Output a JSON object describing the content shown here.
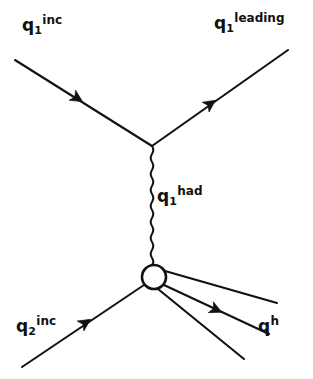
{
  "figure": {
    "kind": "feynman-diagram",
    "background_color": "#ffffff",
    "ink_color": "#111111",
    "width": 313,
    "height": 379
  },
  "labels": {
    "q1_inc": {
      "base": "q",
      "sub": "1",
      "sup": "inc",
      "text": "q1inc"
    },
    "q1_leading": {
      "base": "q",
      "sub": "1",
      "sup": "leading",
      "text": "q1leading"
    },
    "q1_had": {
      "base": "q",
      "sub": "1",
      "sup": "had",
      "text": "q1had"
    },
    "q2_inc": {
      "base": "q",
      "sub": "2",
      "sup": "inc",
      "text": "q2inc"
    },
    "qh": {
      "base": "q",
      "sub": "",
      "sup": "h",
      "text": "qh"
    }
  },
  "vertices": {
    "upper_vertex": {
      "x": 152,
      "y": 146
    },
    "blob": {
      "x": 154,
      "y": 277,
      "radius": 12,
      "fill": "#ffffff",
      "stroke": "#111111"
    }
  },
  "lines": [
    {
      "name": "incoming-quark-1",
      "from": [
        15,
        60
      ],
      "to": [
        152,
        146
      ],
      "style": "straight",
      "arrow_at": [
        80,
        100
      ],
      "arrow_dir": "down-right",
      "label": "q1_inc"
    },
    {
      "name": "leading-quark-1",
      "from": [
        152,
        146
      ],
      "to": [
        288,
        50
      ],
      "style": "straight",
      "arrow_at": [
        213,
        102
      ],
      "arrow_dir": "up-right",
      "label": "q1_leading"
    },
    {
      "name": "hadronic-quark-propagator",
      "from": [
        152,
        146
      ],
      "to": [
        153,
        265
      ],
      "style": "wavy",
      "label": "q1_had"
    },
    {
      "name": "incoming-quark-2",
      "from": [
        22,
        367
      ],
      "to": [
        144,
        285
      ],
      "style": "straight",
      "arrow_at": [
        88,
        321
      ],
      "arrow_dir": "up-right",
      "label": "q2_inc"
    },
    {
      "name": "outgoing-hadron-upper",
      "from": [
        165,
        271
      ],
      "to": [
        277,
        303
      ],
      "style": "straight",
      "arrow_at": null,
      "label": ""
    },
    {
      "name": "outgoing-hadron-middle",
      "from": [
        164,
        285
      ],
      "to": [
        269,
        334
      ],
      "style": "straight",
      "arrow_at": [
        219,
        311
      ],
      "arrow_dir": "down-right",
      "label": "qh"
    },
    {
      "name": "outgoing-hadron-lower",
      "from": [
        158,
        289
      ],
      "to": [
        244,
        359
      ],
      "style": "straight",
      "arrow_at": null,
      "label": ""
    }
  ]
}
